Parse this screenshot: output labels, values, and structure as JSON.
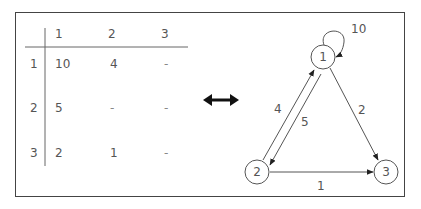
{
  "matrix": {
    "col_headers": [
      "1",
      "2",
      "3"
    ],
    "row_headers": [
      "1",
      "2",
      "3"
    ],
    "rows": [
      [
        "10",
        "4",
        "-"
      ],
      [
        "5",
        "-",
        "-"
      ],
      [
        "2",
        "1",
        "-"
      ]
    ]
  },
  "graph": {
    "nodes": [
      {
        "id": "1",
        "label": "1"
      },
      {
        "id": "2",
        "label": "2"
      },
      {
        "id": "3",
        "label": "3"
      }
    ],
    "edges": [
      {
        "from": "1",
        "to": "1",
        "weight": "10"
      },
      {
        "from": "1",
        "to": "2",
        "weight": "4"
      },
      {
        "from": "2",
        "to": "1",
        "weight": "5"
      },
      {
        "from": "1",
        "to": "3",
        "weight": "2"
      },
      {
        "from": "2",
        "to": "3",
        "weight": "1"
      }
    ]
  },
  "equivalence_icon": "double-headed-arrow"
}
